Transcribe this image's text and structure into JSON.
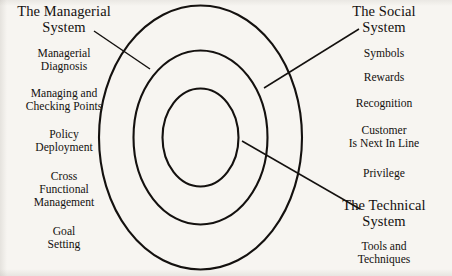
{
  "diagram": {
    "background_color": "#f7f5f1",
    "line_color": "#14110f",
    "rings": [
      {
        "name": "outer-ring",
        "label_ref": "managerial"
      },
      {
        "name": "middle-ring",
        "label_ref": "social"
      },
      {
        "name": "inner-ring",
        "label_ref": "technical"
      }
    ],
    "leader_lines": [
      {
        "name": "managerial-leader",
        "from": "The Managerial System",
        "to": "outer-ring"
      },
      {
        "name": "social-leader",
        "from": "The Social System",
        "to": "middle-ring"
      },
      {
        "name": "technical-leader",
        "from": "The Technical System",
        "to": "inner-ring"
      }
    ]
  },
  "left_column": {
    "heading": "The Managerial System",
    "heading_line1": "The Managerial",
    "heading_line2": "System",
    "items": [
      {
        "line1": "Managerial",
        "line2": "Diagnosis"
      },
      {
        "line1": "Managing and",
        "line2": "Checking Points"
      },
      {
        "line1": "Policy",
        "line2": "Deployment"
      },
      {
        "line1": "Cross",
        "line2": "Functional",
        "line3": "Management"
      },
      {
        "line1": "Goal",
        "line2": "Setting"
      }
    ]
  },
  "right_column": {
    "social": {
      "heading": "The Social System",
      "heading_line1": "The Social",
      "heading_line2": "System",
      "items": [
        {
          "line1": "Symbols"
        },
        {
          "line1": "Rewards"
        },
        {
          "line1": "Recognition"
        },
        {
          "line1": "Customer",
          "line2": "Is Next In Line"
        },
        {
          "line1": "Privilege"
        }
      ]
    },
    "technical": {
      "heading": "The Technical System",
      "heading_line1": "The Technical",
      "heading_line2": "System",
      "items": [
        {
          "line1": "Tools and",
          "line2": "Techniques"
        }
      ]
    }
  }
}
